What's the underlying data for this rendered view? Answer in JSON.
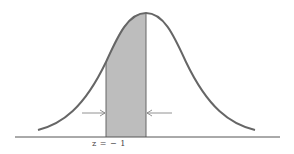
{
  "figure": {
    "z_label": "z = − 1",
    "colors": {
      "curve": "#666666",
      "shade": "#bdbdbd",
      "axis": "#555555",
      "arrow": "#777777"
    }
  }
}
